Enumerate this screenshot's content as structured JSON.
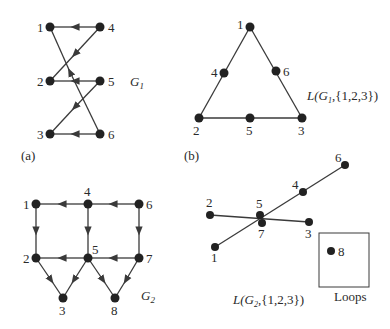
{
  "panels": {
    "a": {
      "caption": "(a)",
      "graph_label": "G",
      "graph_sub": "1",
      "nodes": [
        {
          "id": "1",
          "label": "1",
          "x": 50,
          "y": 27
        },
        {
          "id": "4",
          "label": "4",
          "x": 100,
          "y": 27
        },
        {
          "id": "2",
          "label": "2",
          "x": 50,
          "y": 81
        },
        {
          "id": "5",
          "label": "5",
          "x": 100,
          "y": 81
        },
        {
          "id": "3",
          "label": "3",
          "x": 50,
          "y": 134
        },
        {
          "id": "6",
          "label": "6",
          "x": 100,
          "y": 134
        }
      ],
      "edges": [
        {
          "from": "4",
          "to": "1"
        },
        {
          "from": "4",
          "to": "2"
        },
        {
          "from": "5",
          "to": "2"
        },
        {
          "from": "5",
          "to": "3"
        },
        {
          "from": "6",
          "to": "3"
        },
        {
          "from": "6",
          "to": "1"
        }
      ]
    },
    "b": {
      "caption": "(b)",
      "graph_label": "L(G",
      "graph_sub": "1",
      "graph_label_tail": ",{1,2,3})",
      "nodes": [
        {
          "id": "1",
          "label": "1",
          "x": 250,
          "y": 27
        },
        {
          "id": "4",
          "label": "4",
          "x": 224,
          "y": 73
        },
        {
          "id": "6",
          "label": "6",
          "x": 276,
          "y": 71
        },
        {
          "id": "2",
          "label": "2",
          "x": 199,
          "y": 118
        },
        {
          "id": "5",
          "label": "5",
          "x": 250,
          "y": 118
        },
        {
          "id": "3",
          "label": "3",
          "x": 302,
          "y": 118
        }
      ],
      "edges": [
        {
          "from": "1",
          "to": "2"
        },
        {
          "from": "1",
          "to": "3"
        },
        {
          "from": "2",
          "to": "3"
        }
      ]
    },
    "c": {
      "graph_label": "G",
      "graph_sub": "2",
      "nodes": [
        {
          "id": "1",
          "label": "1",
          "x": 36,
          "y": 204
        },
        {
          "id": "4",
          "label": "4",
          "x": 88,
          "y": 204
        },
        {
          "id": "6",
          "label": "6",
          "x": 139,
          "y": 204
        },
        {
          "id": "2",
          "label": "2",
          "x": 36,
          "y": 258
        },
        {
          "id": "5",
          "label": "5",
          "x": 88,
          "y": 258
        },
        {
          "id": "7",
          "label": "7",
          "x": 139,
          "y": 258
        },
        {
          "id": "3",
          "label": "3",
          "x": 63,
          "y": 298
        },
        {
          "id": "8",
          "label": "8",
          "x": 115,
          "y": 298
        }
      ],
      "edges": [
        {
          "from": "4",
          "to": "1"
        },
        {
          "from": "6",
          "to": "4"
        },
        {
          "from": "1",
          "to": "2"
        },
        {
          "from": "4",
          "to": "5"
        },
        {
          "from": "6",
          "to": "7"
        },
        {
          "from": "5",
          "to": "2"
        },
        {
          "from": "7",
          "to": "5"
        },
        {
          "from": "2",
          "to": "3"
        },
        {
          "from": "5",
          "to": "3"
        },
        {
          "from": "5",
          "to": "8"
        },
        {
          "from": "7",
          "to": "8"
        }
      ]
    },
    "d": {
      "graph_label": "L(G",
      "graph_sub": "2",
      "graph_label_tail": ",{1,2,3})",
      "loops_label": "Loops",
      "nodes": [
        {
          "id": "6",
          "label": "6",
          "x": 345,
          "y": 165
        },
        {
          "id": "4",
          "label": "4",
          "x": 303,
          "y": 192
        },
        {
          "id": "2",
          "label": "2",
          "x": 210,
          "y": 215
        },
        {
          "id": "5",
          "label": "5",
          "x": 260,
          "y": 215
        },
        {
          "id": "7",
          "label": "7",
          "x": 262,
          "y": 223
        },
        {
          "id": "3",
          "label": "3",
          "x": 309,
          "y": 222
        },
        {
          "id": "1",
          "label": "1",
          "x": 215,
          "y": 247
        },
        {
          "id": "8",
          "label": "8",
          "x": 331,
          "y": 251
        }
      ],
      "edges": [
        {
          "from": "1",
          "to": "6"
        },
        {
          "from": "2",
          "to": "3"
        }
      ]
    }
  }
}
